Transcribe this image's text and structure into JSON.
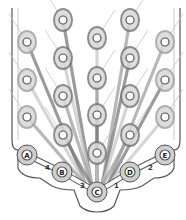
{
  "diagram": {
    "type": "bolt-tightening-sequence",
    "colors": {
      "background": "#ffffff",
      "outline": "#555555",
      "light_stroke": "#c8c8c8",
      "mid_stroke": "#a0a0a0",
      "dark_stroke": "#7a7a7a",
      "bolt_fill": "#ffffff",
      "bolt_ring": "#555555"
    },
    "bolts": [
      {
        "x": 63,
        "y": 20
      },
      {
        "x": 130,
        "y": 20
      },
      {
        "x": 97,
        "y": 38
      },
      {
        "x": 27,
        "y": 42
      },
      {
        "x": 165,
        "y": 42
      },
      {
        "x": 63,
        "y": 58
      },
      {
        "x": 130,
        "y": 58
      },
      {
        "x": 97,
        "y": 78
      },
      {
        "x": 27,
        "y": 80
      },
      {
        "x": 165,
        "y": 80
      },
      {
        "x": 63,
        "y": 96
      },
      {
        "x": 130,
        "y": 96
      },
      {
        "x": 97,
        "y": 115
      },
      {
        "x": 27,
        "y": 117
      },
      {
        "x": 165,
        "y": 117
      },
      {
        "x": 63,
        "y": 135
      },
      {
        "x": 130,
        "y": 135
      },
      {
        "x": 97,
        "y": 153
      }
    ],
    "anchors": [
      {
        "id": "A",
        "label": "A",
        "x": 27,
        "y": 155
      },
      {
        "id": "B",
        "label": "B",
        "x": 62,
        "y": 172
      },
      {
        "id": "C",
        "label": "C",
        "x": 97,
        "y": 192
      },
      {
        "id": "D",
        "label": "D",
        "x": 130,
        "y": 172
      },
      {
        "id": "E",
        "label": "E",
        "x": 165,
        "y": 155
      }
    ],
    "sequence_links": [
      {
        "from": "A",
        "to": "B",
        "step": "4"
      },
      {
        "from": "B",
        "to": "C",
        "step": "3"
      },
      {
        "from": "C",
        "to": "D",
        "step": "1"
      },
      {
        "from": "D",
        "to": "E",
        "step": "2"
      }
    ]
  }
}
